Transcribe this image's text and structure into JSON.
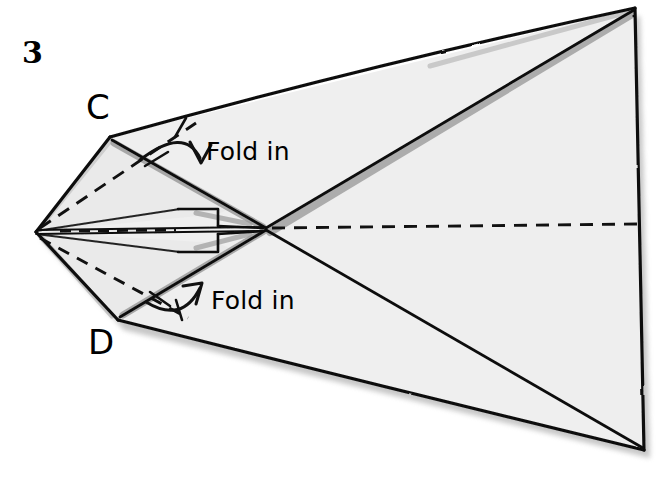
{
  "figure": {
    "step_number": "3",
    "background_color": "#ffffff",
    "paper_fill_color": "#efefef",
    "paper_shadow_color": "#9d9d9d",
    "ink_color": "#000000"
  },
  "labels": {
    "vertex_c": "C",
    "vertex_d": "D",
    "fold_in_top": "Fold in",
    "fold_in_bottom": "Fold in"
  },
  "annotations": {
    "arrow_top_name": "fold-arrow-top",
    "arrow_bottom_name": "fold-arrow-bottom",
    "crease_style": "dashed",
    "edge_style": "solid"
  },
  "geometry": {
    "left_vertex": "36,232",
    "vertex_c": "110,137",
    "vertex_d": "118,320",
    "top_right_apex": "635,8",
    "bottom_right_apex": "645,450",
    "center_crossing": "265,228"
  }
}
